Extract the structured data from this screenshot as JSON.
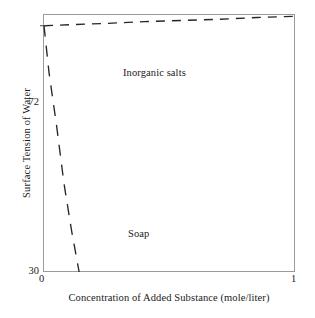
{
  "chart_data": {
    "type": "line",
    "title": "",
    "xlabel": "Concentration of Added Substance (mole/liter)",
    "ylabel": "Surface Tension of Water",
    "xlim": [
      0,
      1
    ],
    "ylim": [
      30,
      74
    ],
    "xticks": [
      "0",
      "1"
    ],
    "yticks": [
      "72",
      "30"
    ],
    "grid": false,
    "legend": "inline-annotations",
    "series": [
      {
        "name": "Inorganic salts",
        "style": "dashed",
        "color": "#262626",
        "x": [
          0.0,
          0.12,
          0.25,
          0.4,
          0.55,
          0.7,
          0.85,
          1.0
        ],
        "y": [
          72.0,
          72.2,
          72.4,
          72.7,
          72.9,
          73.1,
          73.4,
          73.6
        ]
      },
      {
        "name": "Soap",
        "style": "dashed",
        "color": "#262626",
        "x": [
          0.0,
          0.02,
          0.05,
          0.08,
          0.11,
          0.14
        ],
        "y": [
          72.0,
          64.0,
          55.0,
          45.0,
          37.0,
          30.0
        ]
      }
    ],
    "annotations": [
      {
        "text": "Inorganic salts",
        "x": 0.32,
        "y": 73.8
      },
      {
        "text": "Soap",
        "x": 0.34,
        "y": 38.0
      }
    ]
  },
  "axes": {
    "y_title": "Surface Tension of Water",
    "x_title": "Concentration of Added Substance (mole/liter)",
    "y_tick_top": "72",
    "y_tick_bottom": "30",
    "x_tick_left": "0",
    "x_tick_right": "1"
  },
  "labels": {
    "inorganic_salts": "Inorganic salts",
    "soap": "Soap"
  },
  "colors": {
    "frame": "#9a9a9a",
    "line": "#262626",
    "text": "#1a1a1a",
    "background": "#ffffff"
  }
}
